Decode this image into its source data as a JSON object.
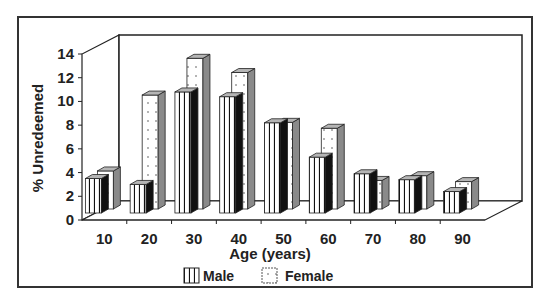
{
  "chart_data": {
    "type": "bar",
    "subtype": "3d-clustered",
    "title": "",
    "xlabel": "Age (years)",
    "ylabel": "% Unredeemed",
    "categories": [
      "10",
      "20",
      "30",
      "40",
      "50",
      "60",
      "70",
      "80",
      "90"
    ],
    "series": [
      {
        "name": "Male",
        "pattern": "vertical-stripes",
        "values": [
          3.5,
          3.0,
          10.8,
          10.4,
          8.2,
          5.3,
          3.9,
          3.4,
          2.4
        ]
      },
      {
        "name": "Female",
        "pattern": "dots",
        "values": [
          3.8,
          10.2,
          13.3,
          12.1,
          7.9,
          7.4,
          3.0,
          3.4,
          2.9
        ]
      }
    ],
    "yticks": [
      0,
      2,
      4,
      6,
      8,
      10,
      12,
      14
    ],
    "ylim": [
      0,
      14
    ],
    "grid": false,
    "legend": {
      "position": "bottom",
      "entries": [
        "Male",
        "Female"
      ]
    }
  },
  "colors": {
    "frame": "#333333",
    "bar_front": "#ffffff",
    "male_side": "#111111",
    "female_side": "#8a8a8a",
    "top_face": "#b5b5b5",
    "text": "#222222"
  }
}
